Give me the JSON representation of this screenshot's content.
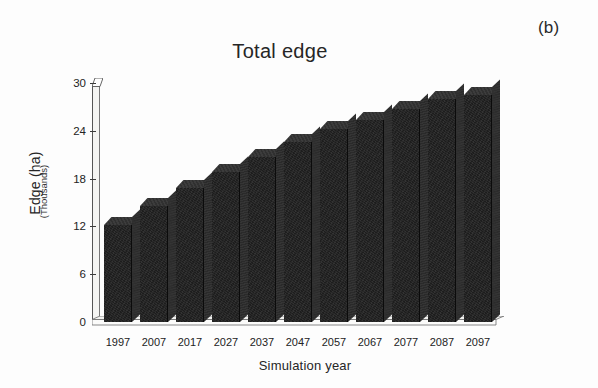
{
  "figure": {
    "panel_label": "(b)",
    "background_color": "#fdfdfd",
    "bar_color": "#1d1d1d",
    "bar_top_color": "#303030",
    "bar_side_color": "#2a2a2a",
    "axis_color": "#3a3a3a"
  },
  "chart_data": {
    "type": "bar",
    "title": "Total edge",
    "xlabel": "Simulation year",
    "ylabel": "Edge (ha)",
    "ylabel_sub": "(Thousands)",
    "categories": [
      "1997",
      "2007",
      "2017",
      "2027",
      "2037",
      "2047",
      "2057",
      "2067",
      "2077",
      "2087",
      "2097"
    ],
    "values": [
      12.2,
      14.6,
      16.8,
      18.8,
      20.7,
      22.6,
      24.2,
      25.4,
      26.7,
      28.0,
      28.5
    ],
    "ylim": [
      0,
      30
    ],
    "yticks": [
      0,
      6,
      12,
      18,
      24,
      30
    ],
    "ytick_labels": [
      "0",
      "6",
      "12",
      "18",
      "24",
      "30"
    ],
    "grid": false,
    "legend": null,
    "series": [
      {
        "name": "Total edge",
        "values": [
          12.2,
          14.6,
          16.8,
          18.8,
          20.7,
          22.6,
          24.2,
          25.4,
          26.7,
          28.0,
          28.5
        ]
      }
    ],
    "style": "3d-column",
    "units": "thousands of hectares"
  }
}
